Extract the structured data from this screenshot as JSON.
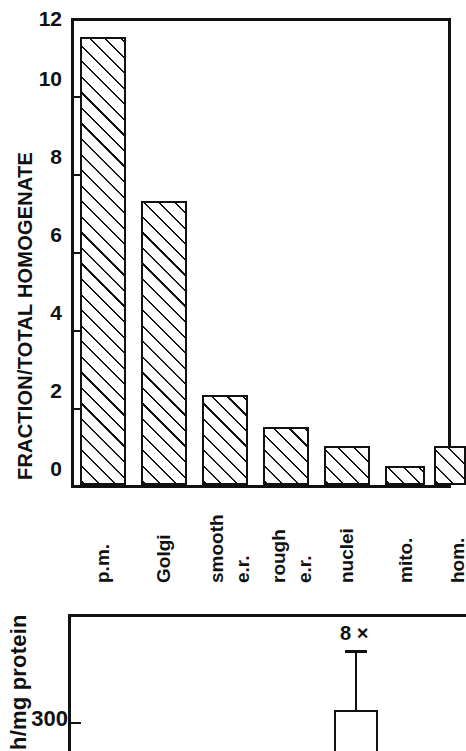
{
  "figure": {
    "background_color": "#ffffff",
    "ink_color": "#111111"
  },
  "chart_data": [
    {
      "id": "panel-top",
      "type": "bar",
      "title": "",
      "xlabel": "",
      "ylabel": "FRACTION/TOTAL HOMOGENATE",
      "ylim": [
        0,
        12
      ],
      "yticks": [
        0,
        2,
        4,
        6,
        8,
        10,
        12
      ],
      "ytick_labels": [
        "0",
        "2",
        "4",
        "6",
        "8",
        "10",
        "12"
      ],
      "grid": false,
      "legend": false,
      "bar_style": "diagonal-hatch",
      "categories": [
        "p.m.",
        "Golgi",
        "smooth e.r.",
        "rough e.r.",
        "nuclei",
        "mito.",
        "hom."
      ],
      "category_lines": [
        [
          "p.m."
        ],
        [
          "Golgi"
        ],
        [
          "smooth",
          "e.r."
        ],
        [
          "rough",
          "e.r."
        ],
        [
          "nuclei"
        ],
        [
          "mito."
        ],
        [
          "hom."
        ]
      ],
      "values": [
        11.5,
        7.3,
        2.3,
        1.5,
        1.0,
        0.5,
        1.0
      ]
    },
    {
      "id": "panel-bottom",
      "type": "bar",
      "title": "",
      "xlabel": "",
      "ylabel": "h/mg protein",
      "ylim": [
        0,
        400
      ],
      "yticks": [
        300
      ],
      "ytick_labels": [
        "300"
      ],
      "grid": false,
      "legend": false,
      "bar_style": "open",
      "cropped": true,
      "categories": [
        ""
      ],
      "values": [
        320
      ],
      "annotations": [
        {
          "text": "8 ×",
          "attached_to_bar_index": 0,
          "kind": "fold-change"
        }
      ],
      "error_bars": [
        {
          "bar_index": 0,
          "upper": 420
        }
      ]
    }
  ],
  "panel_top": {
    "y_axis_title": "FRACTION/TOTAL HOMOGENATE",
    "y_tick_labels": [
      "12",
      "10",
      "8",
      "6",
      "4",
      "2",
      "0"
    ],
    "bars": [
      {
        "label_line1": "p.m.",
        "label_line2": "",
        "value": 11.5
      },
      {
        "label_line1": "Golgi",
        "label_line2": "",
        "value": 7.3
      },
      {
        "label_line1": "smooth",
        "label_line2": "e.r.",
        "value": 2.3
      },
      {
        "label_line1": "rough",
        "label_line2": "e.r.",
        "value": 1.5
      },
      {
        "label_line1": "nuclei",
        "label_line2": "",
        "value": 1.0
      },
      {
        "label_line1": "mito.",
        "label_line2": "",
        "value": 0.5
      },
      {
        "label_line1": "hom.",
        "label_line2": "",
        "value": 1.0
      }
    ]
  },
  "panel_bottom": {
    "y_axis_title": "h/mg protein",
    "y_tick_labels": [
      "300"
    ],
    "bar_annotation": "8 ×"
  }
}
